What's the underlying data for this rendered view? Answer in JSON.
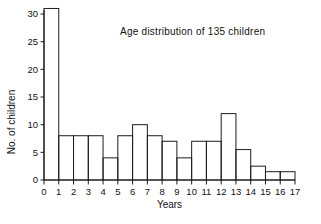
{
  "chart_data": {
    "type": "bar",
    "title": "Age distribution of 135 children",
    "xlabel": "Years",
    "ylabel": "No. of children",
    "grid": false,
    "legend": false,
    "bin_edges": [
      0,
      1,
      2,
      3,
      4,
      5,
      6,
      7,
      8,
      9,
      10,
      11,
      12,
      13,
      14,
      15,
      16,
      17
    ],
    "categories": [
      "0-1",
      "1-2",
      "2-3",
      "3-4",
      "4-5",
      "5-6",
      "6-7",
      "7-8",
      "8-9",
      "9-10",
      "10-11",
      "11-12",
      "12-13",
      "13-14",
      "14-15",
      "15-16",
      "16-17"
    ],
    "values": [
      31,
      8,
      8,
      8,
      4,
      8,
      10,
      8,
      7,
      4,
      7,
      7,
      12,
      5.5,
      2.5,
      1.5,
      1.5
    ],
    "xlim": [
      0,
      17
    ],
    "ylim": [
      0,
      31
    ],
    "xticks": [
      "0",
      "1",
      "2",
      "3",
      "4",
      "5",
      "6",
      "7",
      "8",
      "9",
      "10",
      "11",
      "12",
      "13",
      "14",
      "15",
      "16",
      "17"
    ],
    "yticks": [
      "0",
      "5",
      "10",
      "15",
      "20",
      "25",
      "30"
    ],
    "ytick_values": [
      0,
      5,
      10,
      15,
      20,
      25,
      30
    ],
    "colors": {
      "ink": "#1d1d1d",
      "background": "#ffffff",
      "bar_fill": "none"
    }
  }
}
